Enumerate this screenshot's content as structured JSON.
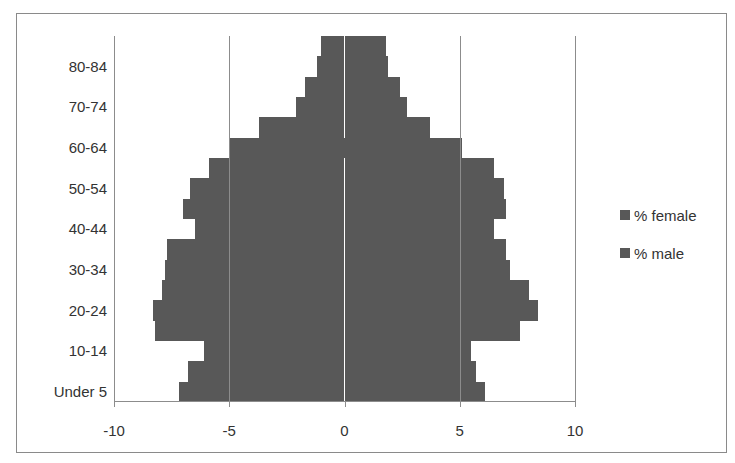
{
  "chart_data": {
    "type": "bar",
    "orientation": "horizontal",
    "title": "",
    "xlabel": "",
    "ylabel": "",
    "xlim": [
      -10,
      10
    ],
    "x_ticks": [
      "-10",
      "-5",
      "0",
      "5",
      "10"
    ],
    "grid": true,
    "legend_position": "right",
    "categories": [
      "Under 5",
      "5-9",
      "10-14",
      "15-19",
      "20-24",
      "25-29",
      "30-34",
      "35-39",
      "40-44",
      "45-49",
      "50-54",
      "55-59",
      "60-64",
      "65-69",
      "70-74",
      "75-79",
      "80-84",
      "85+"
    ],
    "visible_tick_labels": [
      "Under 5",
      "10-14",
      "20-24",
      "30-34",
      "40-44",
      "50-54",
      "60-64",
      "70-74",
      "80-84"
    ],
    "series": [
      {
        "name": "% female",
        "color": "#585858",
        "values": [
          -7.2,
          -6.8,
          -6.1,
          -8.2,
          -8.3,
          -7.9,
          -7.8,
          -7.7,
          -6.5,
          -7.0,
          -6.7,
          -5.9,
          -5.0,
          -3.7,
          -2.1,
          -1.7,
          -1.2,
          -1.0
        ]
      },
      {
        "name": "% male",
        "color": "#585858",
        "values": [
          6.1,
          5.7,
          5.5,
          7.6,
          8.4,
          8.0,
          7.2,
          7.0,
          6.5,
          7.0,
          6.9,
          6.5,
          5.1,
          3.7,
          2.7,
          2.4,
          1.9,
          1.8
        ]
      }
    ]
  },
  "legend": {
    "items": [
      {
        "label": "% female"
      },
      {
        "label": "% male"
      }
    ]
  }
}
